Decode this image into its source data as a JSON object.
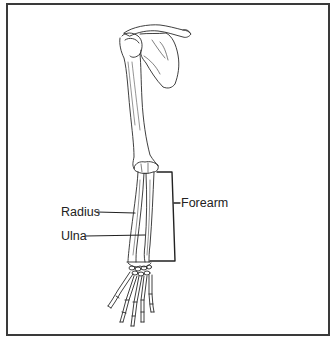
{
  "diagram": {
    "labels": [
      {
        "id": "radius",
        "text": "Radius"
      },
      {
        "id": "ulna",
        "text": "Ulna"
      },
      {
        "id": "forearm",
        "text": "Forearm"
      }
    ],
    "colors": {
      "line": "#2a2a2a",
      "border": "#3a3a3a",
      "background": "#ffffff"
    }
  }
}
